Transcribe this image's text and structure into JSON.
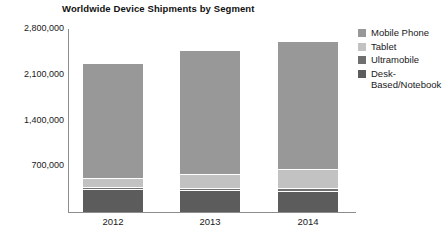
{
  "chart_data": {
    "type": "bar",
    "subtype": "stacked-bar",
    "title": "Worldwide Device Shipments by Segment",
    "xlabel": "",
    "ylabel": "",
    "categories": [
      "2012",
      "2013",
      "2014"
    ],
    "ytick_labels": [
      "700,000",
      "1,400,000",
      "2,100,000",
      "2,800,000"
    ],
    "ytick_values": [
      700000,
      1400000,
      2100000,
      2800000
    ],
    "ylim": [
      0,
      2800000
    ],
    "grid": false,
    "legend_position": "right",
    "series": [
      {
        "name": "Desk-Based/Notebook",
        "color": "#5c5c5c",
        "values": [
          341263,
          315229,
          302315
        ]
      },
      {
        "name": "Ultramobile",
        "color": "#6f6f6f",
        "values": [
          9822,
          23592,
          38687
        ]
      },
      {
        "name": "Tablet",
        "color": "#c2c2c2",
        "values": [
          116113,
          197202,
          265731
        ]
      },
      {
        "name": "Mobile Phone",
        "color": "#989898",
        "values": [
          1746176,
          1875774,
          1949722
        ]
      }
    ],
    "totals": [
      2213374,
      2411797,
      2556455
    ]
  },
  "legend": {
    "items": [
      {
        "label": "Mobile Phone",
        "color": "#989898"
      },
      {
        "label": "Tablet",
        "color": "#c2c2c2"
      },
      {
        "label": "Ultramobile",
        "color": "#6f6f6f"
      },
      {
        "label": "Desk-Based/Notebook",
        "color": "#5c5c5c"
      }
    ]
  },
  "axis": {
    "line_color": "#8d8d8d"
  }
}
